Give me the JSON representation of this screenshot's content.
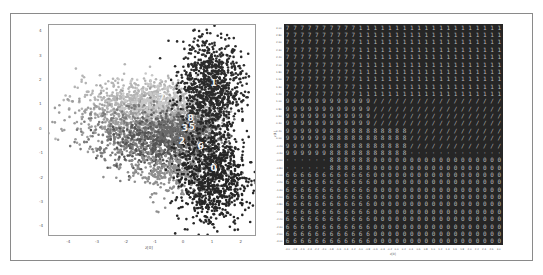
{
  "chart_data": [
    {
      "type": "scatter",
      "title": "",
      "xlabel": "z[0]",
      "ylabel": "z[1]",
      "xlim": [
        -4.7,
        2.5
      ],
      "ylim": [
        -4.4,
        4.3
      ],
      "x_ticks": [
        -4,
        -3,
        -2,
        -1,
        0,
        1,
        2
      ],
      "y_ticks": [
        4,
        3,
        2,
        1,
        0,
        -1,
        -2,
        -3,
        -4
      ],
      "grid": false,
      "legend": "none",
      "annotations": [
        {
          "text": "0",
          "x": 1.0,
          "y": -1.7
        },
        {
          "text": "1",
          "x": 1.0,
          "y": 1.8
        },
        {
          "text": "2",
          "x": -0.1,
          "y": -0.6
        },
        {
          "text": "3",
          "x": 0.0,
          "y": -0.05
        },
        {
          "text": "5",
          "x": 0.25,
          "y": 0.0
        },
        {
          "text": "6",
          "x": 0.55,
          "y": -0.8
        },
        {
          "text": "7",
          "x": -0.8,
          "y": 1.2
        },
        {
          "text": "8",
          "x": 0.2,
          "y": 0.35
        }
      ],
      "series": [
        {
          "name": "9",
          "color": "#b4b4b4",
          "cx": -1.5,
          "cy": 1.2,
          "sx": 1.1,
          "sy": 0.45,
          "n": 520
        },
        {
          "name": "4",
          "color": "#9c9c9c",
          "cx": -1.8,
          "cy": 0.4,
          "sx": 1.2,
          "sy": 0.5,
          "n": 420
        },
        {
          "name": "7",
          "color": "#c8c8c8",
          "cx": -0.9,
          "cy": 1.1,
          "sx": 0.7,
          "sy": 0.4,
          "n": 260
        },
        {
          "name": "5",
          "color": "#7a7a7a",
          "cx": -1.4,
          "cy": -0.3,
          "sx": 1.0,
          "sy": 0.6,
          "n": 460
        },
        {
          "name": "8",
          "color": "#a8a8a8",
          "cx": 0.2,
          "cy": 0.4,
          "sx": 0.55,
          "sy": 0.3,
          "n": 260
        },
        {
          "name": "2",
          "color": "#555555",
          "cx": -0.6,
          "cy": -0.6,
          "sx": 0.9,
          "sy": 0.5,
          "n": 480
        },
        {
          "name": "3",
          "color": "#6a6a6a",
          "cx": -0.1,
          "cy": 0.0,
          "sx": 0.6,
          "sy": 0.35,
          "n": 320
        },
        {
          "name": "6",
          "color": "#8e8e8e",
          "cx": -0.3,
          "cy": -1.7,
          "sx": 0.8,
          "sy": 0.5,
          "n": 400
        },
        {
          "name": "1",
          "color": "#2b2b2b",
          "cx": 0.9,
          "cy": 1.8,
          "sx": 0.55,
          "sy": 0.95,
          "n": 900
        },
        {
          "name": "0",
          "color": "#262626",
          "cx": 1.0,
          "cy": -1.9,
          "sx": 0.6,
          "sy": 1.0,
          "n": 900
        }
      ]
    },
    {
      "type": "heatmap",
      "title": "",
      "xlabel": "z[0]",
      "ylabel": "z[1]",
      "description": "30x30 grid of decoded digits from latent space",
      "grid_size": 30,
      "x_ticks": [
        -3.0,
        -2.8,
        -2.6,
        -2.4,
        -2.2,
        -2.0,
        -1.8,
        -1.6,
        -1.4,
        -1.2,
        -1.0,
        -0.8,
        -0.6,
        -0.4,
        -0.2,
        0.0,
        0.2,
        0.4,
        0.6,
        0.8,
        1.0,
        1.2,
        1.4,
        1.6,
        1.8,
        2.0,
        2.2,
        2.4,
        2.6,
        3.0
      ],
      "y_ticks": [
        3.0,
        2.8,
        2.6,
        2.4,
        2.2,
        2.0,
        1.8,
        1.6,
        1.4,
        1.2,
        1.0,
        0.8,
        0.6,
        0.4,
        0.2,
        0.0,
        -0.2,
        -0.4,
        -0.6,
        -0.8,
        -1.0,
        -1.2,
        -1.4,
        -1.6,
        -1.8,
        -2.0,
        -2.2,
        -2.4,
        -2.6,
        -3.0
      ],
      "regions": [
        {
          "digit": "7",
          "rows": [
            0,
            9
          ],
          "cols": [
            0,
            9
          ]
        },
        {
          "digit": "1",
          "rows": [
            0,
            12
          ],
          "cols": [
            10,
            29
          ]
        },
        {
          "digit": "9",
          "rows": [
            10,
            17
          ],
          "cols": [
            0,
            11
          ]
        },
        {
          "digit": "/",
          "rows": [
            10,
            16
          ],
          "cols": [
            12,
            29
          ]
        },
        {
          "digit": "8",
          "rows": [
            14,
            19
          ],
          "cols": [
            6,
            16
          ]
        },
        {
          "digit": "0",
          "rows": [
            18,
            29
          ],
          "cols": [
            12,
            29
          ]
        },
        {
          "digit": "6",
          "rows": [
            20,
            29
          ],
          "cols": [
            0,
            11
          ]
        }
      ]
    }
  ]
}
